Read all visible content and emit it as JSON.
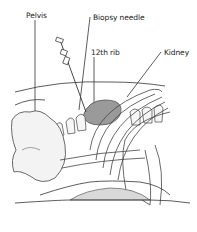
{
  "diagram": {
    "type": "anatomical-illustration",
    "labels": [
      {
        "id": "pelvis",
        "text": "Pelvis",
        "x": 26,
        "y": 12
      },
      {
        "id": "biopsy-needle",
        "text": "Biopsy needle",
        "x": 93,
        "y": 14
      },
      {
        "id": "12th-rib",
        "text": "12th rib",
        "x": 91,
        "y": 49
      },
      {
        "id": "kidney",
        "text": "Kidney",
        "x": 164,
        "y": 49
      }
    ],
    "colors": {
      "line": "#333333",
      "kidney_fill": "#9a9a9a",
      "bone_fill": "#f2f2f2",
      "pad_fill": "#d9d9d9",
      "label": "#222222"
    }
  }
}
